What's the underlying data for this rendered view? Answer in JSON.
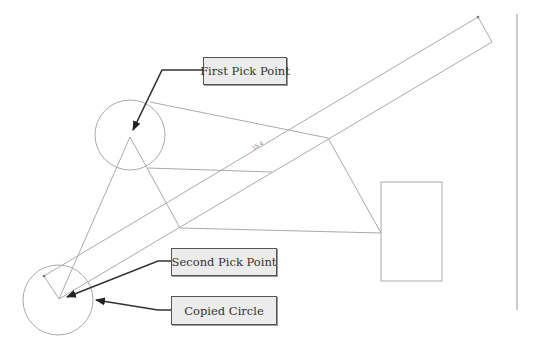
{
  "diagram": {
    "type": "cad-copy-command-illustration",
    "colors": {
      "geometry": "#aaaaaa",
      "leader": "#333333",
      "callout_fill": "#ececec",
      "callout_border": "#555555",
      "callout_text": "#333333"
    },
    "callouts": [
      {
        "id": "first-pick-point",
        "label": "First Pick Point",
        "box": [
          203,
          57,
          83,
          27
        ],
        "leader": [
          [
            203,
            70
          ],
          [
            162,
            70
          ],
          [
            133,
            130
          ]
        ]
      },
      {
        "id": "second-pick-point",
        "label": "Second Pick Point",
        "box": [
          171,
          248,
          105,
          27
        ],
        "leader": [
          [
            171,
            261
          ],
          [
            158,
            261
          ],
          [
            67,
            297
          ]
        ]
      },
      {
        "id": "copied-circle",
        "label": "Copied Circle",
        "box": [
          171,
          296,
          105,
          28
        ],
        "leader": [
          [
            171,
            310
          ],
          [
            158,
            310
          ],
          [
            96,
            300
          ]
        ]
      }
    ],
    "dimension_label": "15.4",
    "shapes": {
      "original_circle": {
        "cx": 130,
        "cy": 135,
        "r": 35
      },
      "copied_circle": {
        "cx": 58,
        "cy": 300,
        "r": 35
      },
      "rectangle": {
        "x": 381,
        "y": 182,
        "w": 61,
        "h": 99
      },
      "band": [
        [
          44,
          276
        ],
        [
          478,
          17
        ],
        [
          492,
          42
        ],
        [
          59,
          299
        ]
      ],
      "triangle": [
        [
          130,
          137
        ],
        [
          59,
          299
        ],
        [
          180,
          228
        ]
      ],
      "lines": [
        [
          [
            150,
            102
          ],
          [
            328,
            138
          ]
        ],
        [
          [
            328,
            138
          ],
          [
            381,
            233
          ]
        ],
        [
          [
            180,
            228
          ],
          [
            381,
            233
          ]
        ],
        [
          [
            148,
            168
          ],
          [
            272,
            172
          ]
        ]
      ],
      "vertical_line": {
        "x": 517,
        "y1": 14,
        "y2": 310
      }
    }
  }
}
